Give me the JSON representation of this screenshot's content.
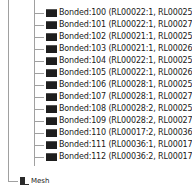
{
  "tree": {
    "bonded_group": {
      "items": [
        {
          "label": "Bonded:100 (RL00022:1, RL00025:1)",
          "icon": "bonded-contact-icon"
        },
        {
          "label": "Bonded:101 (RL00022:1, RL00027:1)",
          "icon": "bonded-contact-icon"
        },
        {
          "label": "Bonded:102 (RL00021:1, RL00025:1)",
          "icon": "bonded-contact-icon"
        },
        {
          "label": "Bonded:103 (RL00021:1, RL00026:1)",
          "icon": "bonded-contact-icon"
        },
        {
          "label": "Bonded:104 (RL00022:1, RL00025:1)",
          "icon": "bonded-contact-icon"
        },
        {
          "label": "Bonded:105 (RL00022:1, RL00026:1)",
          "icon": "bonded-contact-icon"
        },
        {
          "label": "Bonded:106 (RL00028:1, RL00025:1)",
          "icon": "bonded-contact-icon"
        },
        {
          "label": "Bonded:107 (RL00028:1, RL00027:1)",
          "icon": "bonded-contact-icon"
        },
        {
          "label": "Bonded:108 (RL00028:2, RL00025:1)",
          "icon": "bonded-contact-icon"
        },
        {
          "label": "Bonded:109 (RL00028:2, RL00027:1)",
          "icon": "bonded-contact-icon"
        },
        {
          "label": "Bonded:110 (RL00017:2, RL00036:2)",
          "icon": "bonded-contact-icon"
        },
        {
          "label": "Bonded:111 (RL00036:1, RL00017:3)",
          "icon": "bonded-contact-icon"
        },
        {
          "label": "Bonded:112 (RL00036:2, RL00017:4)",
          "icon": "bonded-contact-icon"
        }
      ]
    },
    "mesh": {
      "label": "Mesh",
      "icon": "mesh-icon"
    }
  }
}
